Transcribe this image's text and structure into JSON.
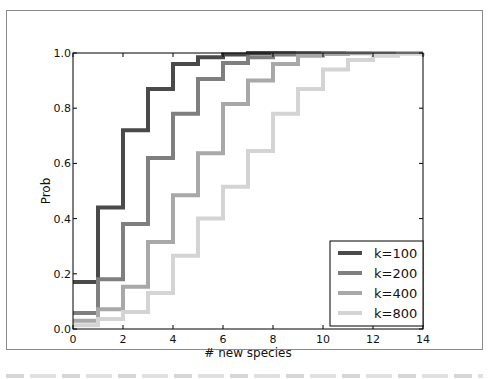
{
  "chart_data": {
    "type": "line",
    "subtype": "step-cdf",
    "title": "",
    "xlabel": "# new species",
    "ylabel": "Prob",
    "xlim": [
      0,
      14
    ],
    "ylim": [
      0.0,
      1.0
    ],
    "xticks": [
      0,
      2,
      4,
      6,
      8,
      10,
      12,
      14
    ],
    "yticks": [
      0.0,
      0.2,
      0.4,
      0.6,
      0.8,
      1.0
    ],
    "xtick_labels": [
      "0",
      "2",
      "4",
      "6",
      "8",
      "10",
      "12",
      "14"
    ],
    "ytick_labels": [
      "0.0",
      "0.2",
      "0.4",
      "0.6",
      "0.8",
      "1.0"
    ],
    "grid": false,
    "legend_position": "lower right",
    "x": [
      0,
      1,
      2,
      3,
      4,
      5,
      6,
      7,
      8,
      9,
      10,
      11,
      12,
      13,
      14
    ],
    "series": [
      {
        "name": "k=100",
        "color": "#4a4a4a",
        "values": [
          0.17,
          0.44,
          0.72,
          0.87,
          0.96,
          0.985,
          0.995,
          1.0,
          1.0,
          1.0,
          1.0,
          1.0,
          1.0,
          1.0,
          1.0
        ]
      },
      {
        "name": "k=200",
        "color": "#7f7f7f",
        "values": [
          0.058,
          0.18,
          0.38,
          0.62,
          0.78,
          0.906,
          0.964,
          0.985,
          0.995,
          0.998,
          1.0,
          1.0,
          1.0,
          1.0,
          1.0
        ]
      },
      {
        "name": "k=400",
        "color": "#a8a8a8",
        "values": [
          0.03,
          0.072,
          0.153,
          0.315,
          0.485,
          0.637,
          0.815,
          0.9,
          0.96,
          0.99,
          0.996,
          0.999,
          1.0,
          1.0,
          1.0
        ]
      },
      {
        "name": "k=800",
        "color": "#d4d4d4",
        "values": [
          0.014,
          0.036,
          0.062,
          0.13,
          0.265,
          0.4,
          0.515,
          0.645,
          0.78,
          0.87,
          0.94,
          0.975,
          0.99,
          0.997,
          1.0
        ]
      }
    ]
  }
}
